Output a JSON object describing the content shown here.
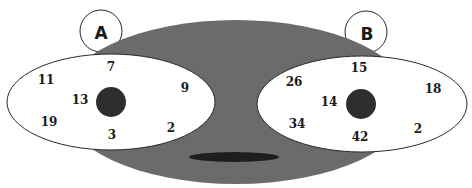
{
  "colors": {
    "background": "#ffffff",
    "face": "#6b6b6b",
    "eye": "#ffffff",
    "outline": "#2a2a2a",
    "pupil": "#2e2e2e",
    "mouth": "#1e1e1e",
    "text": "#1a1a1a"
  },
  "labels": {
    "left_circle": "A",
    "right_circle": "B"
  },
  "left_eye": {
    "numbers": [
      {
        "value": "7",
        "x": 111,
        "y": 71
      },
      {
        "value": "11",
        "x": 46,
        "y": 84
      },
      {
        "value": "9",
        "x": 185,
        "y": 92
      },
      {
        "value": "13",
        "x": 80,
        "y": 104
      },
      {
        "value": "19",
        "x": 49,
        "y": 126
      },
      {
        "value": "3",
        "x": 112,
        "y": 139
      },
      {
        "value": "2",
        "x": 171,
        "y": 132
      }
    ]
  },
  "right_eye": {
    "numbers": [
      {
        "value": "15",
        "x": 359,
        "y": 72
      },
      {
        "value": "26",
        "x": 294,
        "y": 86
      },
      {
        "value": "18",
        "x": 433,
        "y": 93
      },
      {
        "value": "14",
        "x": 329,
        "y": 106
      },
      {
        "value": "34",
        "x": 297,
        "y": 128
      },
      {
        "value": "42",
        "x": 360,
        "y": 141
      },
      {
        "value": "2",
        "x": 418,
        "y": 133
      }
    ]
  }
}
